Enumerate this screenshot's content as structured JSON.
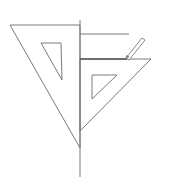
{
  "diagram": {
    "title": "",
    "stroke_color": "#7a7a7a",
    "dark_stroke_color": "#555555",
    "background": "#ffffff",
    "vertical_line": {
      "x1": 80,
      "y1": 20,
      "x2": 80,
      "y2": 177
    },
    "left_set_square": {
      "outer": "10,25 80,25 80,148",
      "inner": "41,43 61,43 62,80"
    },
    "right_set_square": {
      "outer": "80,59 151,59 80,131",
      "inner": "92,75 117,75 92,99"
    },
    "upper_line": {
      "x1": 80,
      "y1": 34,
      "x2": 129,
      "y2": 34
    },
    "drawn_line": {
      "x1": 80,
      "y1": 59,
      "x2": 127,
      "y2": 59
    },
    "pencil": {
      "body": "126,58 142,38 145,40 129,60",
      "tip": "126,58 127,55 129,57"
    }
  }
}
